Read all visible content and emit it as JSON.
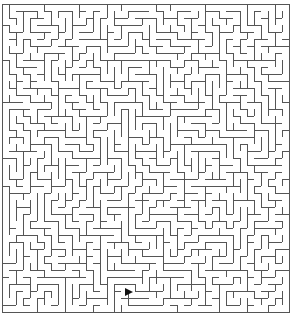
{
  "maze": {
    "origin_x": 2,
    "origin_y": 4,
    "cols": 41,
    "rows": 44,
    "cell_size": 7,
    "wall_color": "#555555",
    "background": "#ffffff",
    "seed": 12345
  },
  "cursor": {
    "icon": "arrow-pointer-icon",
    "x": 124,
    "y": 287,
    "color": "#111111"
  }
}
